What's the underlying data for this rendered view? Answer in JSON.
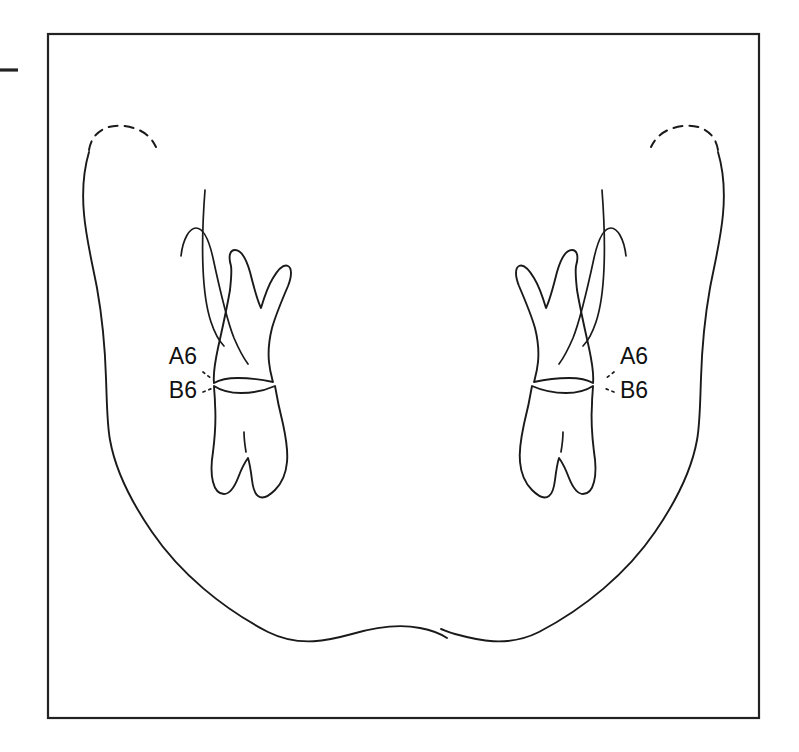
{
  "figure": {
    "type": "anatomical-line-diagram",
    "view": "frontal",
    "background_color": "#ffffff",
    "line_color": "#1a1a1a",
    "frame": {
      "present": true,
      "x": 48,
      "y": 34,
      "width": 711,
      "height": 684,
      "stroke_color": "#222222"
    },
    "edge_tick": {
      "present": true,
      "x1": 0,
      "y1": 70,
      "x2": 18,
      "y2": 70,
      "description": "short horizontal rule outside left frame edge"
    },
    "labels": [
      {
        "id": "left-upper",
        "text": "A6",
        "x": 197,
        "y": 358,
        "anchor": "end",
        "meaning": "upper first molar, left side of drawing"
      },
      {
        "id": "left-lower",
        "text": "B6",
        "x": 197,
        "y": 392,
        "anchor": "end",
        "meaning": "lower first molar, left side of drawing"
      },
      {
        "id": "right-upper",
        "text": "A6",
        "x": 620,
        "y": 358,
        "anchor": "start",
        "meaning": "upper first molar, right side of drawing"
      },
      {
        "id": "right-lower",
        "text": "B6",
        "x": 620,
        "y": 392,
        "anchor": "start",
        "meaning": "lower first molar, right side of drawing"
      }
    ],
    "annotations": {
      "condyle_arcs": "dashed arcs over both condylar heads",
      "leader_marks": "short dotted leader ticks from each label to the occlusal contact point",
      "occlusion_point_left": {
        "x": 213,
        "y": 383
      },
      "occlusion_point_right": {
        "x": 599,
        "y": 383
      }
    },
    "parts": [
      {
        "name": "left-ramus-posterior-border",
        "side": "left"
      },
      {
        "name": "left-condyle-dashed-arc",
        "side": "left"
      },
      {
        "name": "left-coronoid-process",
        "side": "left"
      },
      {
        "name": "left-ramus-anterior-border",
        "side": "left"
      },
      {
        "name": "left-upper-molar-A6",
        "side": "left"
      },
      {
        "name": "left-lower-molar-B6",
        "side": "left"
      },
      {
        "name": "right-ramus-posterior-border",
        "side": "right"
      },
      {
        "name": "right-condyle-dashed-arc",
        "side": "right"
      },
      {
        "name": "right-coronoid-process",
        "side": "right"
      },
      {
        "name": "right-ramus-anterior-border",
        "side": "right"
      },
      {
        "name": "right-upper-molar-A6",
        "side": "right"
      },
      {
        "name": "right-lower-molar-B6",
        "side": "right"
      },
      {
        "name": "mandibular-lower-border",
        "side": "both"
      }
    ]
  }
}
